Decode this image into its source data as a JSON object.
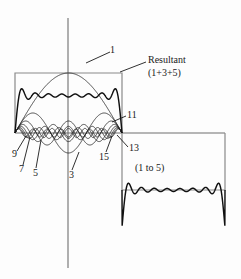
{
  "figure": {
    "background_color": "#fdfdfd",
    "curve_color": "#1a1a1a",
    "axis_color": "#6b6b6b",
    "labels": {
      "harmonic_1": "1",
      "harmonic_3": "3",
      "harmonic_5": "5",
      "harmonic_7": "7",
      "harmonic_9": "9",
      "harmonic_11": "11",
      "harmonic_13": "13",
      "harmonic_15": "15",
      "resultant_line1": "Resultant",
      "resultant_line2": "(1+3+5)",
      "group_range": "(1 to 5)"
    }
  },
  "chart_data": {
    "type": "line",
    "xlabel": "",
    "ylabel": "",
    "grid": false,
    "legend_position": "inline-leader-labels",
    "axes": {
      "vertical_axis_x_px": 68,
      "horizontal_axis_y_px": 133,
      "horizontal_axis_extent_px": [
        15,
        225
      ],
      "vertical_axis_extent_px": [
        18,
        268
      ]
    },
    "square_wave": {
      "description": "Ideal square wave target: positive half-cycle left of origin region, negative half-cycle to the right",
      "amplitude_px": 60,
      "positive_half": {
        "x_start_px": 15,
        "x_end_px": 122,
        "level_px": 73
      },
      "negative_half": {
        "x_start_px": 122,
        "x_end_px": 225,
        "level_px": 190
      }
    },
    "series": [
      {
        "name": "1",
        "label": "1",
        "harmonic": 1,
        "relative_amplitude": 1.0,
        "half_cycles_over_span": 1,
        "description": "Fundamental sine, full arch across the positive half-cycle"
      },
      {
        "name": "3",
        "label": "3",
        "harmonic": 3,
        "relative_amplitude": 0.3333,
        "half_cycles_over_span": 3,
        "description": "Third harmonic, three lobes, one inverted under the axis at center"
      },
      {
        "name": "5",
        "label": "5",
        "harmonic": 5,
        "relative_amplitude": 0.2,
        "half_cycles_over_span": 5
      },
      {
        "name": "7",
        "label": "7",
        "harmonic": 7,
        "relative_amplitude": 0.1429,
        "half_cycles_over_span": 7
      },
      {
        "name": "9",
        "label": "9",
        "harmonic": 9,
        "relative_amplitude": 0.1111,
        "half_cycles_over_span": 9
      },
      {
        "name": "11",
        "label": "11",
        "harmonic": 11,
        "relative_amplitude": 0.0909,
        "half_cycles_over_span": 11
      },
      {
        "name": "13",
        "label": "13",
        "harmonic": 13,
        "relative_amplitude": 0.0769,
        "half_cycles_over_span": 13
      },
      {
        "name": "15",
        "label": "15",
        "harmonic": 15,
        "relative_amplitude": 0.0667,
        "half_cycles_over_span": 15
      },
      {
        "name": "Resultant (1+3+5)",
        "label": "Resultant (1+3+5)",
        "harmonics_summed": [
          1,
          3,
          5,
          7,
          9,
          11,
          13,
          15
        ],
        "description": "Sum of odd harmonics showing Gibbs ripple approximating the square wave flat top",
        "ripple_count": 8
      },
      {
        "name": "(1 to 5)",
        "label": "(1 to 5)",
        "harmonics_summed": [
          1,
          3,
          5
        ],
        "description": "Rippled resultant along the negative half-cycle floor"
      }
    ]
  }
}
